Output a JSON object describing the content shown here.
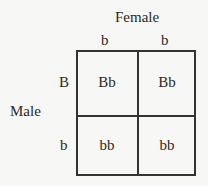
{
  "punnett_square": {
    "column_parent_label": "Female",
    "row_parent_label": "Male",
    "column_alleles": [
      "b",
      "b"
    ],
    "row_alleles": [
      "B",
      "b"
    ],
    "cells": [
      [
        "Bb",
        "Bb"
      ],
      [
        "bb",
        "bb"
      ]
    ]
  }
}
